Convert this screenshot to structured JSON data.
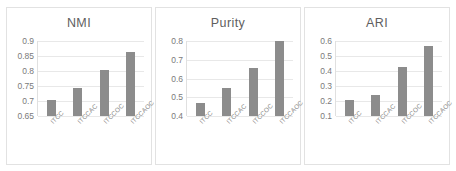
{
  "chart_data": [
    {
      "type": "bar",
      "title": "NMI",
      "categories": [
        "ITCC",
        "ITCCAC",
        "ITCCOC",
        "ITCCAOC"
      ],
      "values": [
        0.705,
        0.745,
        0.805,
        0.862
      ],
      "yticks": [
        "0.65",
        "0.7",
        "0.75",
        "0.8",
        "0.85",
        "0.9"
      ],
      "ytick_values": [
        0.65,
        0.7,
        0.75,
        0.8,
        0.85,
        0.9
      ],
      "ylim": [
        0.65,
        0.9
      ],
      "xlabel": "",
      "ylabel": "",
      "grid": true,
      "legend": "none",
      "bar_color": "#8c8c8c"
    },
    {
      "type": "bar",
      "title": "Purity",
      "categories": [
        "ITCC",
        "ITCCAC",
        "ITCCOC",
        "ITCCAOC"
      ],
      "values": [
        0.47,
        0.55,
        0.655,
        0.8
      ],
      "yticks": [
        "0.4",
        "0.5",
        "0.6",
        "0.7",
        "0.8"
      ],
      "ytick_values": [
        0.4,
        0.5,
        0.6,
        0.7,
        0.8
      ],
      "ylim": [
        0.4,
        0.8
      ],
      "xlabel": "",
      "ylabel": "",
      "grid": true,
      "legend": "none",
      "bar_color": "#8c8c8c"
    },
    {
      "type": "bar",
      "title": "ARI",
      "categories": [
        "ITCC",
        "ITCCAC",
        "ITCCOC",
        "ITCCAOC"
      ],
      "values": [
        0.205,
        0.24,
        0.43,
        0.565
      ],
      "yticks": [
        "0.1",
        "0.2",
        "0.3",
        "0.4",
        "0.5",
        "0.6"
      ],
      "ytick_values": [
        0.1,
        0.2,
        0.3,
        0.4,
        0.5,
        0.6
      ],
      "ylim": [
        0.1,
        0.6
      ],
      "xlabel": "",
      "ylabel": "",
      "grid": true,
      "legend": "none",
      "bar_color": "#8c8c8c"
    }
  ]
}
